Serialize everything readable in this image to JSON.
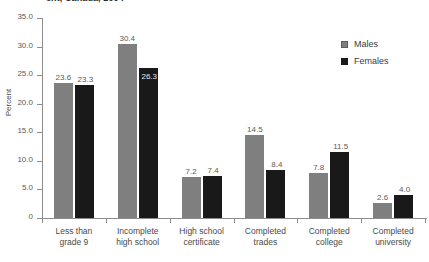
{
  "chart_data": {
    "type": "bar",
    "title": "ent, Canada, 2004",
    "xlabel": "",
    "ylabel": "Percent",
    "ylim": [
      0,
      35
    ],
    "ytick_labels": [
      "0",
      "5.0",
      "10.0",
      "15.0",
      "20.0",
      "25.0",
      "30.0",
      "35.0"
    ],
    "ytick_values": [
      0,
      5,
      10,
      15,
      20,
      25,
      30,
      35
    ],
    "grid": false,
    "legend_position": "right",
    "categories": [
      "Less than\ngrade 9",
      "Incomplete\nhigh school",
      "High school\ncertificate",
      "Completed\ntrades",
      "Completed\ncollege",
      "Completed\nuniversity"
    ],
    "category_lines": [
      [
        "Less than",
        "grade 9"
      ],
      [
        "Incomplete",
        "high school"
      ],
      [
        "High school",
        "certificate"
      ],
      [
        "Completed",
        "trades"
      ],
      [
        "Completed",
        "college"
      ],
      [
        "Completed",
        "university"
      ]
    ],
    "series": [
      {
        "name": "Males",
        "color": "#7f7f7f",
        "values": [
          23.6,
          30.4,
          7.2,
          14.5,
          7.8,
          2.6
        ],
        "labels": [
          "23.6",
          "30.4",
          "7.2",
          "14.5",
          "7.8",
          "2.6"
        ]
      },
      {
        "name": "Females",
        "color": "#191919",
        "values": [
          23.3,
          26.3,
          7.4,
          8.4,
          11.5,
          4.0
        ],
        "labels": [
          "23.3",
          "26.3",
          "7.4",
          "8.4",
          "11.5",
          "4.0"
        ]
      }
    ]
  },
  "legend": {
    "items": [
      {
        "label": "Males",
        "color": "#7f7f7f"
      },
      {
        "label": "Females",
        "color": "#191919"
      }
    ]
  }
}
